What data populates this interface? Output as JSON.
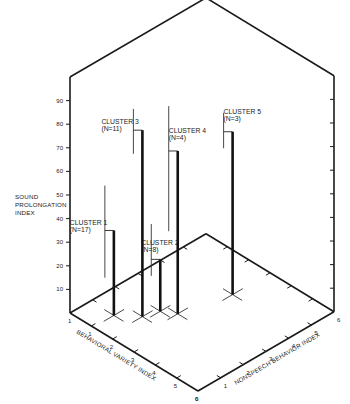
{
  "chart_data": {
    "type": "3d-bar",
    "title": "",
    "zlabel": [
      "SOUND",
      "PROLONGATION",
      "INDEX"
    ],
    "xlabel": "BEHAVIORAL VARIETY INDEX",
    "ylabel": "NONSPEECH BEHAVIOR INDEX",
    "zlim": [
      0,
      100
    ],
    "xlim": [
      0,
      6
    ],
    "ylim": [
      0,
      6
    ],
    "z_ticks": [
      "10",
      "20",
      "30",
      "40",
      "50",
      "60",
      "70",
      "80",
      "90"
    ],
    "x_ticks": [
      "1",
      "2",
      "3",
      "4",
      "5",
      "6"
    ],
    "y_ticks": [
      "1",
      "2",
      "3",
      "4",
      "5",
      "6"
    ],
    "x_origin_label": "1",
    "y_origin_label": "0",
    "series": [
      {
        "name": "CLUSTER 1",
        "n_label": "(N=17)",
        "bvi": 1.1,
        "nbi": 0.9,
        "value": 36,
        "range": [
          16,
          55
        ]
      },
      {
        "name": "CLUSTER 2",
        "n_label": "(N=8)",
        "bvi": 2.0,
        "nbi": 2.1,
        "value": 22,
        "range": [
          15,
          37
        ]
      },
      {
        "name": "CLUSTER 3",
        "n_label": "(N=11)",
        "bvi": 1.8,
        "nbi": 1.5,
        "value": 79,
        "range": [
          69,
          88
        ]
      },
      {
        "name": "CLUSTER 4",
        "n_label": "(N=4)",
        "bvi": 2.5,
        "nbi": 2.4,
        "value": 69,
        "range": [
          35,
          88
        ]
      },
      {
        "name": "CLUSTER 5",
        "n_label": "(N=3)",
        "bvi": 3.0,
        "nbi": 4.35,
        "value": 69,
        "range": [
          62,
          77
        ]
      }
    ]
  }
}
